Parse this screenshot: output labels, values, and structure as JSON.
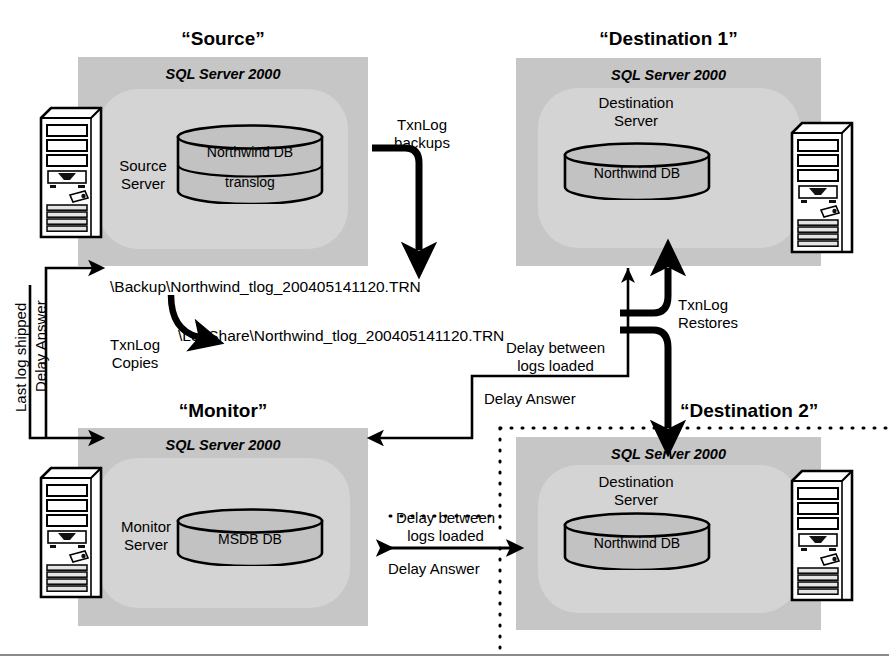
{
  "diagram": {
    "title_source": "“Source”",
    "title_destination1": "“Destination 1”",
    "title_monitor": "“Monitor”",
    "title_destination2": "“Destination 2”",
    "sql_server_label": "SQL Server 2000"
  },
  "source": {
    "title": "“Source”",
    "sql_label": "SQL Server 2000",
    "role": "Source\nServer",
    "role_line1": "Source",
    "role_line2": "Server",
    "db_top": "Northwind DB",
    "db_bottom": "translog"
  },
  "destination1": {
    "title": "“Destination 1”",
    "sql_label": "SQL Server 2000",
    "role_line1": "Destination",
    "role_line2": "Server",
    "db_top": "Northwind DB"
  },
  "monitor": {
    "title": "“Monitor”",
    "sql_label": "SQL Server 2000",
    "role_line1": "Monitor",
    "role_line2": "Server",
    "db_top": "MSDB DB"
  },
  "destination2": {
    "title": "“Destination 2”",
    "sql_label": "SQL Server 2000",
    "role_line1": "Destination",
    "role_line2": "Server",
    "db_top": "Northwind DB"
  },
  "labels": {
    "txnlog_backups_l1": "TxnLog",
    "txnlog_backups_l2": "backups",
    "backup_path": "\\Backup\\Northwind_tlog_200405141120.TRN",
    "logshare_path": "\\LogShare\\Northwind_tlog_200405141120.TRN",
    "txnlog_copies_l1": "TxnLog",
    "txnlog_copies_l2": "Copies",
    "txnlog_restores_l1": "TxnLog",
    "txnlog_restores_l2": "Restores",
    "delay_between_mid_l1": "Delay between",
    "delay_between_mid_l2": "logs loaded",
    "delay_answer_mid": "Delay Answer",
    "delay_between_bot_l1": "Delay between",
    "delay_between_bot_l2": "logs loaded",
    "delay_answer_bot": "Delay Answer",
    "last_log_shipped": "Last log shipped",
    "delay_answer_left": "Delay Answer"
  },
  "colors": {
    "group_box": "#c6c6c6",
    "group_inner": "#d4d4d4",
    "cylinder_fill": "#c2c2c2",
    "line": "#000000",
    "page_bg": "#ffffff",
    "rule": "#8a8a8a"
  }
}
